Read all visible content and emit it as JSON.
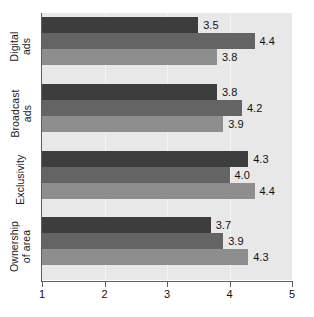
{
  "chart_data": {
    "type": "bar",
    "orientation": "horizontal",
    "title": "",
    "subtitle": "",
    "xlabel": "",
    "ylabel": "",
    "xlim": [
      1,
      5
    ],
    "xticks": [
      "1",
      "2",
      "3",
      "4",
      "5"
    ],
    "grid": true,
    "legend": "none",
    "categories": [
      "Digital ads",
      "Broadcast ads",
      "Exclusivity",
      "Ownership of area"
    ],
    "category_lines": [
      [
        "Digital",
        "ads"
      ],
      [
        "Broadcast",
        "ads"
      ],
      [
        "Exclusivity"
      ],
      [
        "Ownership",
        "of area"
      ]
    ],
    "series": [
      {
        "name": "series-1",
        "color": "#3d3d3d",
        "values": [
          3.5,
          3.8,
          4.3,
          3.7
        ],
        "labels": [
          "3.5",
          "3.8",
          "4.3",
          "3.7"
        ]
      },
      {
        "name": "series-2",
        "color": "#646464",
        "values": [
          4.4,
          4.2,
          4.0,
          3.9
        ],
        "labels": [
          "4.4",
          "4.2",
          "4.0",
          "3.9"
        ]
      },
      {
        "name": "series-3",
        "color": "#8e8e8e",
        "values": [
          3.8,
          3.9,
          4.4,
          4.3
        ],
        "labels": [
          "3.8",
          "3.9",
          "4.4",
          "4.3"
        ]
      }
    ]
  },
  "style": {
    "plot_background": "#e8e8e8",
    "page_background": "#ffffff",
    "gridline_color": "#f4f4f4",
    "axis_color": "#5e5e5e",
    "text_color": "#111111"
  }
}
